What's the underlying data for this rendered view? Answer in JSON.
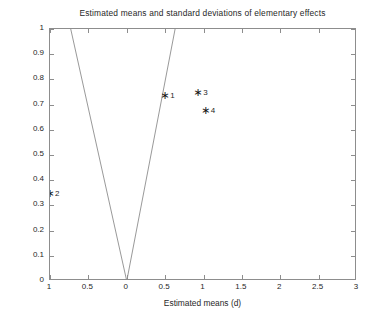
{
  "chart_data": {
    "type": "scatter",
    "title": "Estimated means and standard deviations of elementary effects",
    "xlabel": "Estimated means (d)",
    "ylabel": "Standard deviations (S)",
    "xlim": [
      -1,
      3
    ],
    "ylim": [
      0,
      1
    ],
    "grid": false,
    "legend": "none",
    "xticks": [
      -1,
      -0.5,
      0,
      0.5,
      1,
      1.5,
      2,
      2.5,
      3
    ],
    "xtick_labels": [
      "1",
      "0.5",
      "0",
      "0.5",
      "1",
      "1.5",
      "2",
      "2.5",
      "3"
    ],
    "yticks": [
      0,
      0.1,
      0.2,
      0.3,
      0.4,
      0.5,
      0.6,
      0.7,
      0.8,
      0.9,
      1
    ],
    "ytick_labels": [
      "0",
      "0.1",
      "0.2",
      "0.3",
      "0.4",
      "0.5",
      "0.6",
      "0.7",
      "0.8",
      "0.9",
      "1"
    ],
    "marker": "asterisk",
    "marker_color": "#151515",
    "line_color": "#8d8d8d",
    "frame_color": "#8d8d8d",
    "background": "#ffffff",
    "points": [
      {
        "label": "1",
        "x": 0.5,
        "y": 0.74
      },
      {
        "label": "2",
        "x": -1.0,
        "y": 0.35
      },
      {
        "label": "3",
        "x": 0.93,
        "y": 0.75
      },
      {
        "label": "4",
        "x": 1.03,
        "y": 0.68
      }
    ],
    "reference_lines": [
      {
        "name": "left-wedge-line",
        "x0": 0,
        "y0": 0,
        "x1": -0.73,
        "y1": 1
      },
      {
        "name": "right-wedge-line",
        "x0": 0,
        "y0": 0,
        "x1": 0.63,
        "y1": 1
      }
    ]
  }
}
